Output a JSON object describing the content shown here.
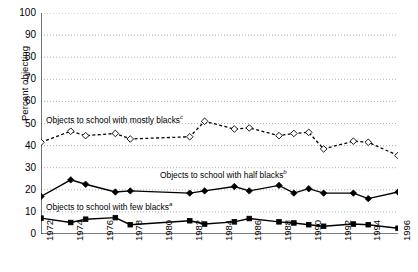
{
  "chart_data": {
    "type": "line",
    "title": "",
    "xlabel": "",
    "ylabel": "Percent objecting",
    "ylim": [
      0,
      100
    ],
    "ytick_step": 10,
    "ytick_labels": [
      "0",
      "10",
      "20",
      "30",
      "40",
      "50",
      "60",
      "70",
      "80",
      "90",
      "100"
    ],
    "xlim": [
      1972,
      1996
    ],
    "xtick_labels": [
      "1972",
      "1974",
      "1976",
      "1978",
      "1980",
      "1982",
      "1984",
      "1986",
      "1988",
      "1990",
      "1992",
      "1994",
      "1996"
    ],
    "xtick_years": [
      1972,
      1974,
      1976,
      1978,
      1980,
      1982,
      1984,
      1986,
      1988,
      1990,
      1992,
      1994,
      1996
    ],
    "x_minor_years": [
      1972,
      1973,
      1974,
      1975,
      1976,
      1977,
      1978,
      1979,
      1980,
      1981,
      1982,
      1983,
      1984,
      1985,
      1986,
      1987,
      1988,
      1989,
      1990,
      1991,
      1992,
      1993,
      1994,
      1995,
      1996
    ],
    "grid": "horizontal-dotted",
    "legend": "inline-annotations",
    "x": [
      1972,
      1974,
      1975,
      1977,
      1978,
      1982,
      1983,
      1985,
      1986,
      1988,
      1989,
      1990,
      1991,
      1993,
      1994,
      1996
    ],
    "series": [
      {
        "name": "Objects to school with mostly blacks",
        "footnote": "c",
        "marker": "open-diamond",
        "line": "dashed",
        "color": "#000000",
        "values": [
          41.5,
          46.5,
          44.5,
          45.5,
          43.0,
          44.0,
          51.0,
          47.5,
          48.0,
          44.5,
          45.5,
          46.0,
          38.5,
          42.0,
          41.5,
          35.5
        ]
      },
      {
        "name": "Objects to school with half blacks",
        "footnote": "b",
        "marker": "filled-diamond",
        "line": "solid",
        "color": "#000000",
        "values": [
          17.0,
          24.5,
          22.5,
          19.0,
          19.5,
          18.5,
          19.5,
          21.5,
          19.5,
          22.0,
          18.5,
          20.5,
          18.5,
          18.5,
          16.0,
          19.0
        ]
      },
      {
        "name": "Objects to school with few blacks",
        "footnote": "a",
        "marker": "filled-square",
        "line": "solid",
        "color": "#000000",
        "values": [
          7.2,
          5.2,
          6.7,
          7.4,
          4.2,
          6.0,
          4.5,
          5.5,
          7.0,
          5.5,
          5.0,
          4.2,
          3.5,
          4.5,
          4.2,
          2.6
        ]
      }
    ],
    "annotations": [
      {
        "text": "Objects to school with mostly blacks",
        "sup": "c",
        "x_px": 46,
        "y_px": 114
      },
      {
        "text": "Objects to school with half blacks",
        "sup": "b",
        "x_px": 160,
        "y_px": 169
      },
      {
        "text": "Objects to school with few blacks",
        "sup": "a",
        "x_px": 46,
        "y_px": 201
      }
    ]
  }
}
